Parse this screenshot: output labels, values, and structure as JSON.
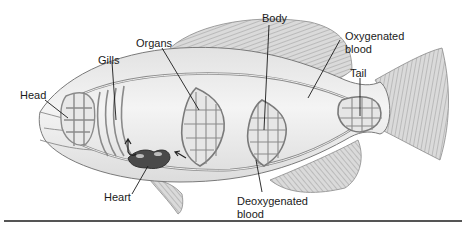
{
  "diagram": {
    "labels": {
      "head": "Head",
      "gills": "Gills",
      "organs": "Organs",
      "body": "Body",
      "oxygenated_line1": "Oxygenated",
      "oxygenated_line2": "blood",
      "tail": "Tail",
      "heart": "Heart",
      "deoxygenated_line1": "Deoxygenated",
      "deoxygenated_line2": "blood"
    },
    "colors": {
      "outline": "#6e6e6e",
      "vessel": "#8a8a8a",
      "body_fill": "#ececec",
      "fin_fill": "#d4d4d4",
      "heart": "#4a4a4a",
      "text": "#1a1a1a",
      "rule": "#555555"
    }
  }
}
